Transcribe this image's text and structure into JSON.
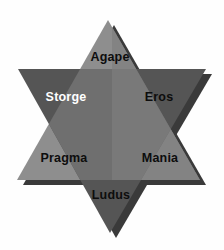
{
  "figure": {
    "name": "six-love-styles-hexagram",
    "shape": "hexagram",
    "background_color": "#fefefe"
  },
  "triangles": {
    "upward": {
      "name": "upward-triangle",
      "fill": "#8e8e8e",
      "points": "108,20 200,180 17,180"
    },
    "downward": {
      "name": "downward-triangle",
      "fill": "#555555",
      "points": "110,233 18,69 206,69"
    },
    "shadow": {
      "name": "drop-shadow",
      "fill": "#3a3a3a",
      "offset_x": 6,
      "offset_y": 5
    },
    "overlap": {
      "name": "overlap-core",
      "fill": "#6f6f6f"
    }
  },
  "labels": [
    {
      "id": "agape",
      "text": "Agape",
      "x": 110,
      "y": 57,
      "color": "#0d0d0d",
      "tone": "dark"
    },
    {
      "id": "storge",
      "text": "Storge",
      "x": 66,
      "y": 97,
      "color": "#ffffff",
      "tone": "light"
    },
    {
      "id": "eros",
      "text": "Eros",
      "x": 159,
      "y": 97,
      "color": "#0d0d0d",
      "tone": "dark"
    },
    {
      "id": "pragma",
      "text": "Pragma",
      "x": 64,
      "y": 158,
      "color": "#0d0d0d",
      "tone": "dark"
    },
    {
      "id": "mania",
      "text": "Mania",
      "x": 160,
      "y": 158,
      "color": "#0d0d0d",
      "tone": "dark"
    },
    {
      "id": "ludus",
      "text": "Ludus",
      "x": 111,
      "y": 195,
      "color": "#0d0d0d",
      "tone": "dark"
    }
  ],
  "chart_data": {
    "type": "diagram",
    "title": "",
    "categories": [
      "Agape",
      "Storge",
      "Eros",
      "Pragma",
      "Mania",
      "Ludus"
    ],
    "values": [
      1,
      1,
      1,
      1,
      1,
      1
    ],
    "legend": []
  }
}
